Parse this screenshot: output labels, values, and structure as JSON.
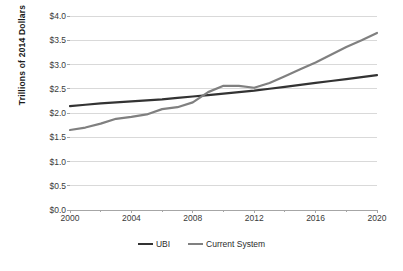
{
  "chart_data": {
    "type": "line",
    "title": "",
    "xlabel": "",
    "ylabel": "Trillions of 2014 Dollars",
    "xlim": [
      2000,
      2020
    ],
    "ylim": [
      0.0,
      4.0
    ],
    "ytick_step": 0.5,
    "xtick_step": 4,
    "xminor_step": 2,
    "grid": "horizontal",
    "legend_position": "bottom-center",
    "x": [
      2000,
      2001,
      2002,
      2003,
      2004,
      2005,
      2006,
      2007,
      2008,
      2009,
      2010,
      2011,
      2012,
      2013,
      2014,
      2015,
      2016,
      2017,
      2018,
      2019,
      2020
    ],
    "ytick_labels": [
      "$0.0",
      "$0.5",
      "$1.0",
      "$1.5",
      "$2.0",
      "$2.5",
      "$3.0",
      "$3.5",
      "$4.0"
    ],
    "ytick_values": [
      0.0,
      0.5,
      1.0,
      1.5,
      2.0,
      2.5,
      3.0,
      3.5,
      4.0
    ],
    "xtick_labels": [
      "2000",
      "2004",
      "2008",
      "2012",
      "2016",
      "2020"
    ],
    "xtick_values": [
      2000,
      2004,
      2008,
      2012,
      2016,
      2020
    ],
    "xminor_values": [
      2002,
      2006,
      2010,
      2014,
      2018
    ],
    "series": [
      {
        "name": "UBI",
        "color": "#333333",
        "width": 2.2,
        "values": [
          2.14,
          2.17,
          2.2,
          2.22,
          2.24,
          2.26,
          2.28,
          2.31,
          2.34,
          2.37,
          2.4,
          2.43,
          2.46,
          2.5,
          2.54,
          2.58,
          2.62,
          2.66,
          2.7,
          2.74,
          2.78
        ]
      },
      {
        "name": "Current System",
        "color": "#808080",
        "width": 2.2,
        "values": [
          1.65,
          1.7,
          1.78,
          1.88,
          1.92,
          1.97,
          2.08,
          2.12,
          2.22,
          2.43,
          2.56,
          2.56,
          2.52,
          2.62,
          2.76,
          2.9,
          3.04,
          3.2,
          3.36,
          3.5,
          3.65
        ]
      }
    ]
  },
  "legend": {
    "items": [
      {
        "label": "UBI",
        "color": "#333333"
      },
      {
        "label": "Current System",
        "color": "#808080"
      }
    ]
  },
  "axis": {
    "y_title": "Trillions of 2014 Dollars"
  },
  "colors": {
    "grid": "#d9d9d9",
    "axis": "#a6a6a6",
    "text": "#3a3a3a",
    "background": "#ffffff",
    "ubi": "#333333",
    "current_system": "#808080"
  }
}
